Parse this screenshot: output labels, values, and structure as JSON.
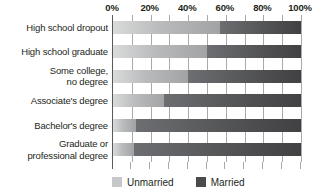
{
  "chart_data": {
    "type": "bar",
    "orientation": "horizontal",
    "stacked": true,
    "stacked_percent": true,
    "title": "",
    "subtitle": "",
    "xlabel": "",
    "ylabel": "",
    "xlim": [
      0,
      100
    ],
    "grid": true,
    "grid_axis": "x",
    "legend_position": "bottom",
    "axis_position": "top",
    "xticks": [
      0,
      20,
      40,
      60,
      80,
      100
    ],
    "xtick_labels": [
      "0%",
      "20%",
      "40%",
      "60%",
      "80%",
      "100%"
    ],
    "categories": [
      "High school dropout",
      "High school graduate",
      "Some college,\nno degree",
      "Associate's degree",
      "Bachelor's degree",
      "Graduate or\nprofessional degree"
    ],
    "category_lines": [
      [
        "High school dropout"
      ],
      [
        "High school graduate"
      ],
      [
        "Some college,",
        "no degree"
      ],
      [
        "Associate's degree"
      ],
      [
        "Bachelor's degree"
      ],
      [
        "Graduate or",
        "professional degree"
      ]
    ],
    "series": [
      {
        "name": "Unmarried",
        "color": "#b9babb",
        "values": [
          57,
          50,
          40,
          27,
          12,
          11
        ]
      },
      {
        "name": "Married",
        "color": "#58595b",
        "values": [
          43,
          50,
          60,
          73,
          88,
          89
        ]
      }
    ]
  },
  "legend": {
    "items": [
      {
        "label": "Unmarried",
        "swatch_class": "swatch-unmarried",
        "name": "legend-swatch-unmarried"
      },
      {
        "label": "Married",
        "swatch_class": "swatch-married",
        "name": "legend-swatch-married"
      }
    ]
  },
  "colors": {
    "unmarried": "#b9babb",
    "married": "#58595b",
    "gridline": "#a7a9ac",
    "axis": "#58595b",
    "text": "#231f20",
    "background": "#ffffff"
  }
}
